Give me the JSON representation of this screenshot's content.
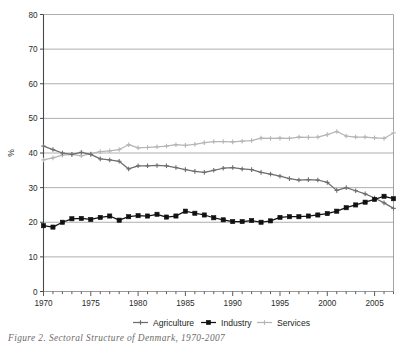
{
  "figure": {
    "caption": "Figure 2. Sectoral Structure of Denmark, 1970-2007"
  },
  "axes": {
    "y_title": "%",
    "y_ticks": [
      "0",
      "10",
      "20",
      "30",
      "40",
      "50",
      "60",
      "70",
      "80"
    ],
    "x_ticks": [
      "1970",
      "1975",
      "1980",
      "1985",
      "1990",
      "1995",
      "2000",
      "2005"
    ]
  },
  "legend": {
    "items": [
      {
        "label": "Agriculture",
        "color": "#6d6d6d",
        "marker": "cross"
      },
      {
        "label": "Industry",
        "color": "#111111",
        "marker": "square"
      },
      {
        "label": "Services",
        "color": "#b5b5b5",
        "marker": "cross"
      }
    ]
  },
  "chart_data": {
    "type": "line",
    "title": "",
    "xlabel": "",
    "ylabel": "%",
    "xlim": [
      1970,
      2007
    ],
    "ylim": [
      0,
      80
    ],
    "ytick_step": 10,
    "grid": "horizontal",
    "legend_position": "bottom",
    "x": [
      1970,
      1971,
      1972,
      1973,
      1974,
      1975,
      1976,
      1977,
      1978,
      1979,
      1980,
      1981,
      1982,
      1983,
      1984,
      1985,
      1986,
      1987,
      1988,
      1989,
      1990,
      1991,
      1992,
      1993,
      1994,
      1995,
      1996,
      1997,
      1998,
      1999,
      2000,
      2001,
      2002,
      2003,
      2004,
      2005,
      2006,
      2007
    ],
    "series": [
      {
        "name": "Agriculture",
        "color": "#6d6d6d",
        "marker": "cross",
        "values": [
          42.0,
          41.0,
          40.0,
          39.6,
          40.2,
          39.6,
          38.3,
          38.0,
          37.6,
          35.4,
          36.3,
          36.3,
          36.4,
          36.3,
          35.8,
          35.2,
          34.7,
          34.4,
          35.0,
          35.6,
          35.8,
          35.4,
          35.2,
          34.4,
          33.9,
          33.3,
          32.6,
          32.2,
          32.3,
          32.2,
          31.5,
          29.2,
          30.0,
          29.1,
          28.2,
          27.0,
          25.6,
          24.0
        ]
      },
      {
        "name": "Industry",
        "color": "#111111",
        "marker": "square",
        "values": [
          19.0,
          18.6,
          20.0,
          21.0,
          21.1,
          20.8,
          21.4,
          21.8,
          20.6,
          21.6,
          21.9,
          21.8,
          22.3,
          21.5,
          21.8,
          23.2,
          22.6,
          22.1,
          21.3,
          20.7,
          20.2,
          20.2,
          20.5,
          20.0,
          20.4,
          21.4,
          21.6,
          21.6,
          21.8,
          22.1,
          22.5,
          23.2,
          24.2,
          25.0,
          25.8,
          26.6,
          27.5,
          26.8
        ]
      },
      {
        "name": "Services",
        "color": "#b5b5b5",
        "marker": "cross",
        "values": [
          38.0,
          38.6,
          39.4,
          39.6,
          39.2,
          39.8,
          40.4,
          40.6,
          41.0,
          42.4,
          41.5,
          41.6,
          41.8,
          42.0,
          42.4,
          42.2,
          42.5,
          43.0,
          43.3,
          43.3,
          43.2,
          43.4,
          43.6,
          44.3,
          44.2,
          44.3,
          44.2,
          44.6,
          44.5,
          44.6,
          45.3,
          46.2,
          44.9,
          44.6,
          44.6,
          44.4,
          44.2,
          45.8
        ]
      }
    ]
  }
}
